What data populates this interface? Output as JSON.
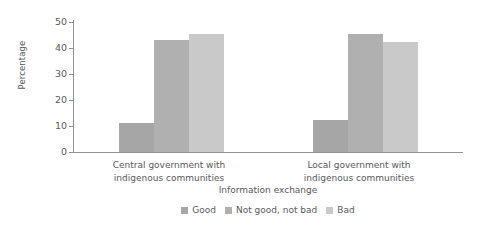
{
  "chart_data": {
    "type": "bar",
    "title": "",
    "xlabel": "Information exchange",
    "ylabel": "Percentage",
    "categories": [
      "Central government with indigenous communities",
      "Local government with indigenous communities"
    ],
    "series": [
      {
        "name": "Good",
        "values": [
          11.2,
          12.3
        ],
        "color": "#a6a6a6"
      },
      {
        "name": "Not good, not bad",
        "values": [
          43.0,
          45.5
        ],
        "color": "#b0b0b0"
      },
      {
        "name": "Bad",
        "values": [
          45.5,
          42.5
        ],
        "color": "#c9c9c9"
      }
    ],
    "ylim": [
      0,
      50
    ],
    "yticks": [
      0,
      10,
      20,
      30,
      40,
      50
    ],
    "ytick_labels": [
      "0",
      "10",
      "20",
      "30",
      "40",
      "50"
    ],
    "grid": false,
    "legend_position": "bottom"
  },
  "axes": {
    "y_title": "Percentage",
    "x_title": "Information exchange"
  },
  "category_labels": [
    {
      "line1": "Central government with",
      "line2": "indigenous communities"
    },
    {
      "line1": "Local government with",
      "line2": "indigenous communities"
    }
  ],
  "legend": {
    "items": [
      {
        "label": "Good",
        "color": "#a6a6a6"
      },
      {
        "label": "Not good, not bad",
        "color": "#b0b0b0"
      },
      {
        "label": "Bad",
        "color": "#c9c9c9"
      }
    ]
  },
  "colors": {
    "axis": "#959595",
    "text": "#58595b",
    "background": "#ffffff"
  }
}
